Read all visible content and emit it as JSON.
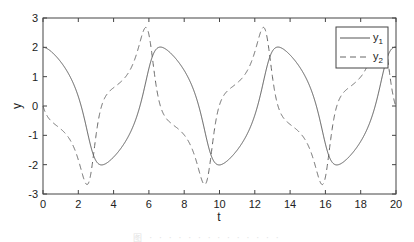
{
  "chart_data": {
    "type": "line",
    "title": "",
    "xlabel": "t",
    "ylabel": "y",
    "xlim": [
      0,
      20
    ],
    "ylim": [
      -3,
      3
    ],
    "xticks": [
      0,
      2,
      4,
      6,
      8,
      10,
      12,
      14,
      16,
      18,
      20
    ],
    "yticks": [
      -3,
      -2,
      -1,
      0,
      1,
      2,
      3
    ],
    "grid": false,
    "legend_position": "upper right",
    "model": "van der pol oscillator, mu=1, y1(0)=2, y2(0)=0",
    "series": [
      {
        "name": "y1",
        "style": "solid",
        "color": "#555555",
        "x": [
          0,
          1,
          2,
          3,
          3.3,
          4,
          5,
          6,
          6.6,
          7,
          8,
          9,
          9.7,
          10,
          11,
          12,
          13,
          13.3,
          14,
          15,
          16,
          16.7,
          17,
          18,
          19,
          20
        ],
        "values": [
          2.0,
          1.5,
          0.3,
          -1.8,
          -2.0,
          -1.85,
          -1.3,
          0.5,
          2.0,
          1.9,
          1.3,
          -0.4,
          -1.95,
          -2.0,
          -1.5,
          -0.2,
          1.9,
          2.0,
          1.8,
          1.2,
          -0.7,
          -2.0,
          -1.95,
          -1.4,
          0.8,
          2.0
        ]
      },
      {
        "name": "y2",
        "style": "dashed",
        "color": "#666666",
        "x": [
          0,
          1,
          2,
          2.5,
          3,
          3.5,
          4,
          5,
          5.5,
          5.9,
          6.2,
          6.6,
          7,
          8,
          9,
          9.3,
          9.7,
          10,
          11,
          12,
          12.5,
          13,
          14,
          15,
          15.8,
          16.3,
          17,
          18,
          19,
          19.6,
          20
        ],
        "values": [
          0.0,
          -0.7,
          -1.5,
          -2.7,
          -0.2,
          0.5,
          0.7,
          1.3,
          2.2,
          2.7,
          1.5,
          0.0,
          -0.5,
          -0.9,
          -1.9,
          -2.7,
          -0.5,
          0.5,
          0.9,
          1.5,
          2.7,
          0.2,
          -0.6,
          -1.2,
          -2.7,
          -0.6,
          0.6,
          1.0,
          1.7,
          2.7,
          0.0
        ]
      }
    ]
  },
  "legend": {
    "items": [
      {
        "base": "y",
        "sub": "1",
        "style": "solid"
      },
      {
        "base": "y",
        "sub": "2",
        "style": "dashed"
      }
    ]
  },
  "axes": {
    "xlabel": "t",
    "ylabel": "y"
  },
  "caption": "图 · · · · · · · · · · · · · ·"
}
